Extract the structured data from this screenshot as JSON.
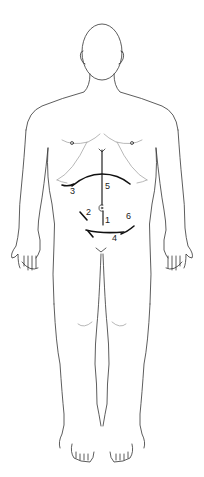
{
  "diagram": {
    "line_color": "#333333",
    "incision_color": "#111111",
    "incisions": [
      {
        "id": "1",
        "label": "1",
        "description": "lower midline (infraumbilical)"
      },
      {
        "id": "2",
        "label": "2",
        "description": "left-side short oblique"
      },
      {
        "id": "3",
        "label": "3",
        "description": "right subcostal"
      },
      {
        "id": "4",
        "label": "4",
        "description": "transverse suprapubic (Pfannenstiel)"
      },
      {
        "id": "5",
        "label": "5",
        "description": "upper midline / chevron (bilateral subcostal)"
      },
      {
        "id": "6",
        "label": "6",
        "description": "right-side lower oblique"
      }
    ]
  }
}
